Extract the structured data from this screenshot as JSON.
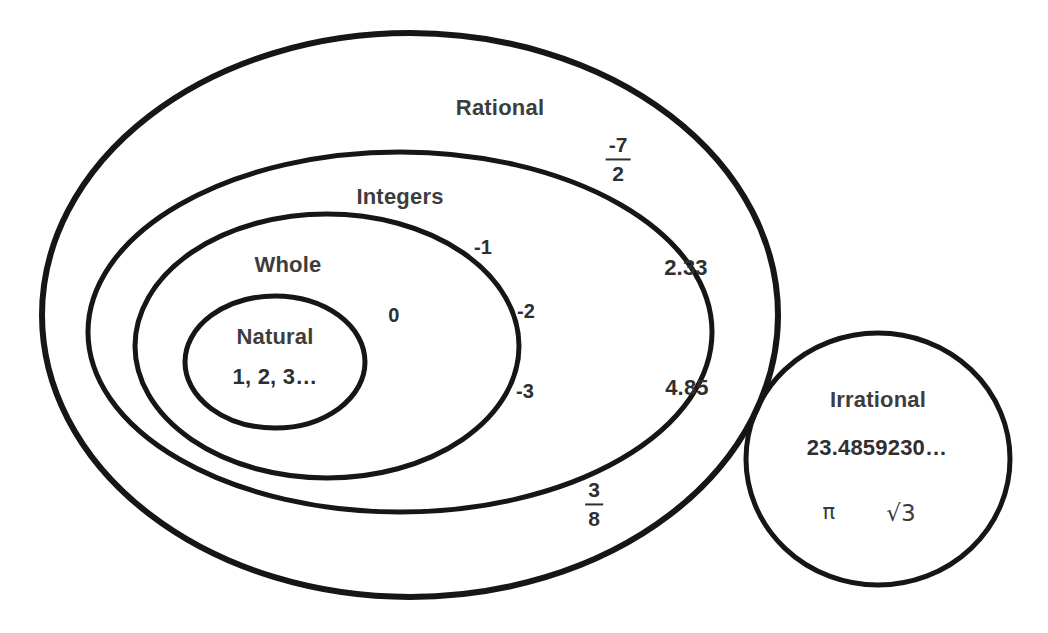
{
  "diagram": {
    "type": "venn-nested-sets",
    "stroke_color": "#161616",
    "text_color": "#3a3a3a",
    "background": "#ffffff",
    "sets": [
      {
        "id": "rational",
        "label": "Rational",
        "shape": "ellipse",
        "cx": 410,
        "cy": 315,
        "rx": 368,
        "ry": 282,
        "stroke_width": 6,
        "label_x": 500,
        "label_y": 108,
        "contains": [
          "integers"
        ]
      },
      {
        "id": "integers",
        "label": "Integers",
        "shape": "ellipse",
        "cx": 400,
        "cy": 332,
        "rx": 312,
        "ry": 180,
        "stroke_width": 5,
        "label_x": 400,
        "label_y": 197,
        "contains": [
          "whole"
        ]
      },
      {
        "id": "whole",
        "label": "Whole",
        "shape": "ellipse",
        "cx": 327,
        "cy": 346,
        "rx": 192,
        "ry": 132,
        "stroke_width": 5,
        "label_x": 288,
        "label_y": 265,
        "contains": [
          "natural"
        ]
      },
      {
        "id": "natural",
        "label": "Natural",
        "shape": "ellipse",
        "cx": 275,
        "cy": 362,
        "rx": 90,
        "ry": 66,
        "stroke_width": 5,
        "label_x": 275,
        "label_y": 337,
        "contains": []
      },
      {
        "id": "irrational",
        "label": "Irrational",
        "shape": "circle",
        "cx": 878,
        "cy": 459,
        "rx": 132,
        "ry": 126,
        "stroke_width": 5,
        "label_x": 878,
        "label_y": 400,
        "contains": []
      }
    ],
    "members": [
      {
        "id": "natural-examples",
        "set": "natural",
        "text": "1, 2, 3…",
        "x": 275,
        "y": 377,
        "size": "big"
      },
      {
        "id": "zero",
        "set": "whole",
        "text": "0",
        "x": 394,
        "y": 315,
        "size": "sm"
      },
      {
        "id": "neg-one",
        "set": "integers",
        "text": "-1",
        "x": 483,
        "y": 247,
        "size": "sm"
      },
      {
        "id": "neg-two",
        "set": "integers",
        "text": "-2",
        "x": 526,
        "y": 311,
        "size": "sm"
      },
      {
        "id": "neg-three",
        "set": "integers",
        "text": "-3",
        "x": 525,
        "y": 391,
        "size": "sm"
      },
      {
        "id": "two-point-three-three",
        "set": "rational",
        "text": "2.33",
        "x": 686,
        "y": 268,
        "size": "big"
      },
      {
        "id": "four-point-eight-five",
        "set": "rational",
        "text": "4.85",
        "x": 687,
        "y": 388,
        "size": "big"
      },
      {
        "id": "irrational-decimal",
        "set": "irrational",
        "text": "23.4859230…",
        "x": 877,
        "y": 448,
        "size": "big"
      }
    ],
    "fractions": [
      {
        "id": "neg-seven-halves",
        "set": "rational",
        "numerator": "-7",
        "denominator": "2",
        "x": 618,
        "y": 160
      },
      {
        "id": "three-eighths",
        "set": "rational",
        "numerator": "3",
        "denominator": "8",
        "x": 594,
        "y": 505
      }
    ],
    "symbols": [
      {
        "id": "pi-symbol",
        "set": "irrational",
        "text": "π",
        "x": 829,
        "y": 512,
        "kind": "greek"
      },
      {
        "id": "sqrt-three",
        "set": "irrational",
        "text": "√3",
        "x": 901,
        "y": 513,
        "kind": "radical"
      }
    ]
  }
}
